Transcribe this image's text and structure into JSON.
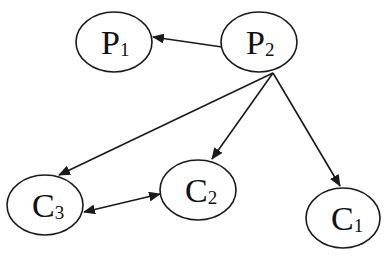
{
  "diagram": {
    "type": "directed-graph",
    "stroke_color": "#1a1a1a",
    "background": "#ffffff",
    "nodes": [
      {
        "id": "P1",
        "main": "P",
        "sub": "1",
        "cx": 114,
        "cy": 42,
        "rx": 38,
        "ry": 30
      },
      {
        "id": "P2",
        "main": "P",
        "sub": "2",
        "cx": 259,
        "cy": 42,
        "rx": 38,
        "ry": 30
      },
      {
        "id": "C3",
        "main": "C",
        "sub": "3",
        "cx": 45,
        "cy": 205,
        "rx": 38,
        "ry": 30
      },
      {
        "id": "C2",
        "main": "C",
        "sub": "2",
        "cx": 198,
        "cy": 190,
        "rx": 38,
        "ry": 30
      },
      {
        "id": "C1",
        "main": "C",
        "sub": "1",
        "cx": 343,
        "cy": 218,
        "rx": 37,
        "ry": 30
      }
    ],
    "edges": [
      {
        "from": "P2",
        "to": "P1",
        "bidirectional": false
      },
      {
        "from": "P2",
        "to": "C3",
        "bidirectional": false
      },
      {
        "from": "P2",
        "to": "C2",
        "bidirectional": false
      },
      {
        "from": "P2",
        "to": "C1",
        "bidirectional": false
      },
      {
        "from": "C3",
        "to": "C2",
        "bidirectional": true
      }
    ]
  }
}
